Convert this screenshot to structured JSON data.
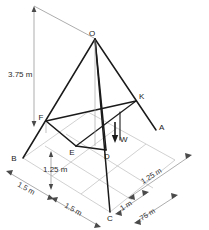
{
  "figure": {
    "colors": {
      "solid_lines": "#1a1a1a",
      "grid_lines": "#bdbdbd",
      "dimension_lines": "#8a8a8a",
      "label_text": "#1a1a1a",
      "background": "#ffffff"
    },
    "vertices": [
      {
        "id": "O",
        "label": "O",
        "x": 95,
        "y": 38,
        "tx": 92,
        "ty": 35
      },
      {
        "id": "K",
        "label": "K",
        "x": 136,
        "y": 101,
        "tx": 137,
        "ty": 99
      },
      {
        "id": "A",
        "label": "A",
        "x": 156,
        "y": 130,
        "tx": 157,
        "ty": 129
      },
      {
        "id": "F",
        "label": "F",
        "x": 46,
        "y": 121,
        "tx": 41,
        "ty": 119
      },
      {
        "id": "E",
        "label": "E",
        "x": 76,
        "y": 146,
        "tx": 73,
        "ty": 151
      },
      {
        "id": "D",
        "label": "D",
        "x": 106,
        "y": 150,
        "tx": 107,
        "ty": 157
      },
      {
        "id": "B",
        "label": "B",
        "x": 23,
        "y": 158,
        "tx": 15,
        "ty": 160
      },
      {
        "id": "C",
        "label": "C",
        "x": 110,
        "y": 212,
        "tx": 110,
        "ty": 218
      },
      {
        "id": "W",
        "label": "W",
        "x": 117,
        "y": 140,
        "tx": 120,
        "ty": 141
      }
    ],
    "dimensions": [
      {
        "id": "height",
        "label": "3.75 m",
        "tx": 10,
        "ty": 74,
        "rotate": 0
      },
      {
        "id": "depth-left",
        "label": "1.25 m",
        "tx": 42,
        "ty": 168,
        "rotate": 0
      },
      {
        "id": "base-left",
        "label": "1.5 m",
        "tx": 18,
        "ty": 183,
        "rotate": 28
      },
      {
        "id": "base-front",
        "label": "1.5 m",
        "tx": 64,
        "ty": 203,
        "rotate": 28
      },
      {
        "id": "base-right",
        "label": "1.25 m",
        "tx": 152,
        "ty": 180,
        "rotate": -30
      },
      {
        "id": "front-right-1",
        "label": "1 m",
        "tx": 127,
        "ty": 210,
        "rotate": -30
      },
      {
        "id": "front-right-2",
        "label": ".75 m",
        "tx": 143,
        "ty": 219,
        "rotate": -30
      }
    ],
    "caption": ""
  }
}
